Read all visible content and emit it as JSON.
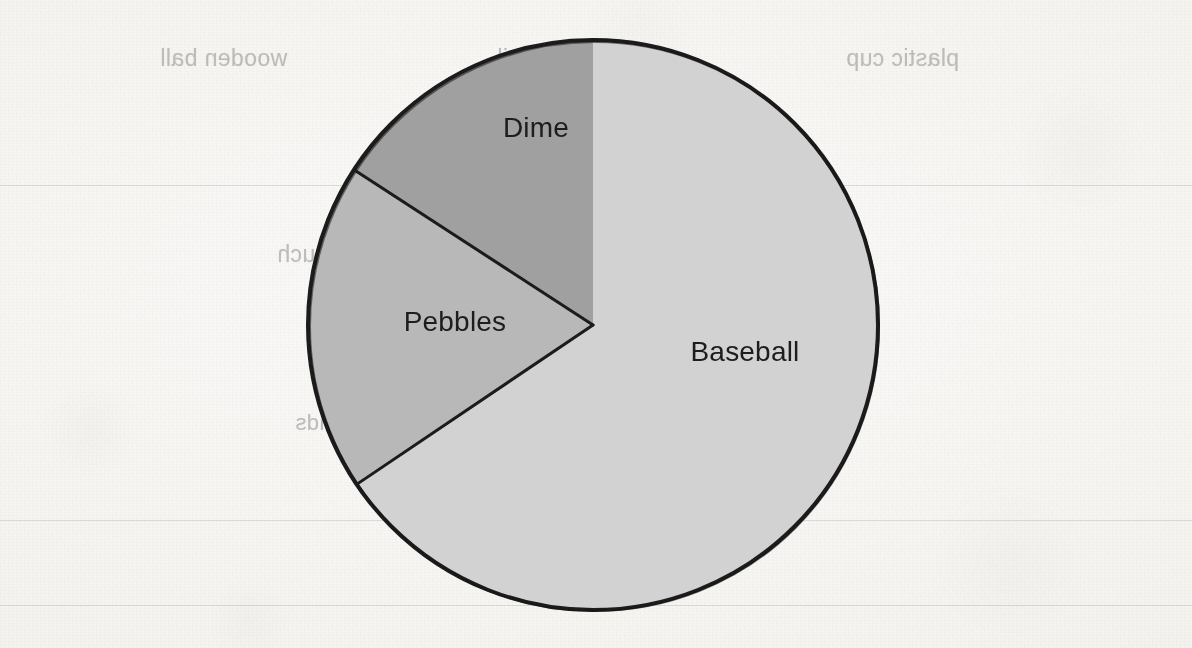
{
  "chart_data": {
    "type": "pie",
    "title": "",
    "legend_position": "inside-slices",
    "grid": false,
    "labels": [
      "Baseball",
      "Pebbles",
      "Dime"
    ],
    "values": [
      65.6,
      18.6,
      15.8
    ],
    "units": "percent",
    "start_angle_deg": 0,
    "direction": "clockwise",
    "slices": [
      {
        "label": "Baseball",
        "value": 65.6,
        "start_angle_deg": 0,
        "end_angle_deg": 236,
        "sweep_deg": 236,
        "fill": "#d2d2d2",
        "label_x": 745,
        "label_y": 352
      },
      {
        "label": "Pebbles",
        "value": 18.6,
        "start_angle_deg": 236,
        "end_angle_deg": 303,
        "sweep_deg": 67,
        "fill": "#b8b8b8",
        "label_x": 455,
        "label_y": 322
      },
      {
        "label": "Dime",
        "value": 15.8,
        "start_angle_deg": 303,
        "end_angle_deg": 360,
        "sweep_deg": 57,
        "fill": "#a0a0a0",
        "label_x": 536,
        "label_y": 128
      }
    ],
    "geometry": {
      "center_x": 593,
      "center_y": 325,
      "radius": 285,
      "outline_color": "#1a1a1a",
      "outline_width": 4,
      "divider_color": "#1a1a1a",
      "divider_width": 3
    }
  },
  "colors": {
    "paper": "#f4f3f0",
    "ink": "#1a1a1a",
    "label_text": "#1d1d1d",
    "bleed_text": "#9a9a98",
    "rule_line": "#787a80",
    "slice_baseball": "#d2d2d2",
    "slice_pebbles": "#b8b8b8",
    "slice_dime": "#a0a0a0"
  },
  "labels": {
    "baseball": "Baseball",
    "pebbles": "Pebbles",
    "dime": "Dime"
  },
  "bleed_through": {
    "note": "mirrored text showing through from the reverse side of the worksheet page",
    "items": [
      {
        "id": "wooden-ball",
        "text": "wooden ball",
        "x": 160,
        "y": 45,
        "size": "b-body"
      },
      {
        "id": "iron-nail",
        "text": "iron nail",
        "x": 497,
        "y": 45,
        "size": "b-body"
      },
      {
        "id": "plastic-cup",
        "text": "plastic cup",
        "x": 846,
        "y": 45,
        "size": "b-body"
      },
      {
        "id": "q20-line1",
        "text": "20. If you weighed 75 pounds on Earth, how much",
        "x": 277,
        "y": 241,
        "size": "b-head"
      },
      {
        "id": "q20-line2",
        "text": "would you likely weigh on the Moon? Explain",
        "x": 308,
        "y": 282,
        "size": "b-body"
      },
      {
        "id": "q20-line3",
        "text": "your answer.",
        "x": 308,
        "y": 323,
        "size": "b-body"
      },
      {
        "id": "choice-a",
        "text": "A  100 pounds",
        "x": 295,
        "y": 410,
        "size": "b-small"
      },
      {
        "id": "choice-b",
        "text": "B  150 pounds",
        "x": 525,
        "y": 410,
        "size": "b-small"
      },
      {
        "id": "choice-c",
        "text": "C  40 pounds",
        "x": 733,
        "y": 410,
        "size": "b-small"
      }
    ]
  },
  "ruled_lines": {
    "y_positions": [
      185,
      520,
      605
    ]
  }
}
